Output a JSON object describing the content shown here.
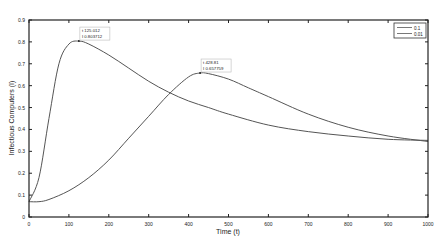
{
  "chart_data": {
    "type": "line",
    "title": "",
    "xlabel": "Time (t)",
    "ylabel": "Infectious Computers (I)",
    "xlim": [
      0,
      1000
    ],
    "ylim": [
      0,
      0.9
    ],
    "xticks": [
      "0",
      "100",
      "200",
      "300",
      "400",
      "500",
      "600",
      "700",
      "800",
      "900",
      "1000"
    ],
    "yticks": [
      "0",
      "0.1",
      "0.2",
      "0.3",
      "0.4",
      "0.5",
      "0.6",
      "0.7",
      "0.8",
      "0.9"
    ],
    "grid": false,
    "legend_position": "upper right",
    "series": [
      {
        "name": "0.1",
        "color": "#555555",
        "x": [
          0,
          25,
          50,
          75,
          100,
          125,
          150,
          200,
          250,
          300,
          350,
          400,
          450,
          500,
          600,
          700,
          800,
          900,
          1000
        ],
        "y": [
          0.07,
          0.18,
          0.45,
          0.7,
          0.79,
          0.8037,
          0.79,
          0.74,
          0.68,
          0.62,
          0.57,
          0.53,
          0.5,
          0.47,
          0.42,
          0.39,
          0.37,
          0.355,
          0.35
        ]
      },
      {
        "name": "0.01",
        "color": "#555555",
        "x": [
          0,
          25,
          50,
          100,
          150,
          200,
          250,
          300,
          350,
          400,
          428,
          450,
          500,
          550,
          600,
          700,
          800,
          900,
          1000
        ],
        "y": [
          0.07,
          0.07,
          0.08,
          0.12,
          0.18,
          0.26,
          0.36,
          0.46,
          0.56,
          0.64,
          0.6577,
          0.655,
          0.63,
          0.59,
          0.55,
          0.47,
          0.41,
          0.37,
          0.345
        ]
      }
    ],
    "annotations": [
      {
        "x": 125.012,
        "y": 0.803712,
        "line1": "t 125.012",
        "line2": "I 0.803712"
      },
      {
        "x": 428.81,
        "y": 0.657759,
        "line1": "t 428.81",
        "line2": "I 0.657759"
      }
    ]
  }
}
